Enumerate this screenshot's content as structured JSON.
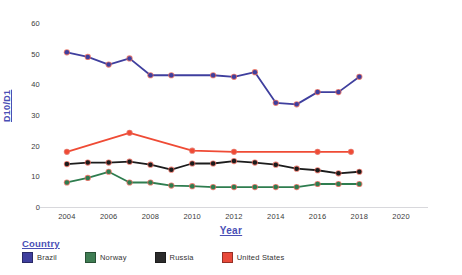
{
  "chart_data": {
    "type": "line",
    "title": "",
    "xlabel": "Year",
    "ylabel": "D10/D1",
    "xlim": [
      2003,
      2021
    ],
    "ylim": [
      0,
      63
    ],
    "xticks": [
      2004,
      2006,
      2008,
      2010,
      2012,
      2014,
      2016,
      2018,
      2020
    ],
    "yticks": [
      0,
      10,
      20,
      30,
      40,
      50,
      60
    ],
    "grid": false,
    "legend_title": "Country",
    "legend_position": "bottom-left",
    "series": [
      {
        "name": "Brazil",
        "color": "#3f3f9e",
        "x": [
          2004,
          2005,
          2006,
          2007,
          2008,
          2009,
          2011,
          2012,
          2013,
          2014,
          2015,
          2016,
          2017,
          2018
        ],
        "values": [
          50.5,
          49.0,
          46.5,
          48.5,
          43.0,
          43.0,
          43.0,
          42.5,
          44.0,
          34.0,
          33.5,
          37.5,
          37.5,
          42.5
        ]
      },
      {
        "name": "Norway",
        "color": "#2e7d4f",
        "x": [
          2004,
          2005,
          2006,
          2007,
          2008,
          2009,
          2010,
          2011,
          2012,
          2013,
          2014,
          2015,
          2016,
          2017,
          2018
        ],
        "values": [
          8.0,
          9.5,
          11.5,
          8.0,
          8.0,
          7.0,
          6.8,
          6.5,
          6.5,
          6.5,
          6.5,
          6.5,
          7.5,
          7.5,
          7.5
        ]
      },
      {
        "name": "Russia",
        "color": "#1c1c1c",
        "x": [
          2004,
          2005,
          2006,
          2007,
          2008,
          2009,
          2010,
          2011,
          2012,
          2013,
          2014,
          2015,
          2016,
          2017,
          2018
        ],
        "values": [
          14.0,
          14.5,
          14.5,
          14.8,
          13.8,
          12.2,
          14.2,
          14.2,
          15.0,
          14.5,
          13.8,
          12.5,
          12.0,
          11.0,
          11.5
        ]
      },
      {
        "name": "United States",
        "color": "#ef4b35",
        "x": [
          2004,
          2007,
          2010,
          2012,
          2016,
          2017.6
        ],
        "values": [
          18.0,
          24.2,
          18.4,
          18.0,
          18.0,
          18.0
        ]
      }
    ]
  },
  "axes": {
    "y_title": "D10/D1",
    "x_title": "Year",
    "y_tick_labels": [
      "0",
      "10",
      "20",
      "30",
      "40",
      "50",
      "60"
    ],
    "x_tick_labels": [
      "2004",
      "2006",
      "2008",
      "2010",
      "2012",
      "2014",
      "2016",
      "2018",
      "2020"
    ]
  },
  "legend": {
    "title": "Country",
    "items": [
      {
        "label": "Brazil",
        "color": "#3f3f9e"
      },
      {
        "label": "Norway",
        "color": "#3f7d53"
      },
      {
        "label": "Russia",
        "color": "#2b2b2b"
      },
      {
        "label": "United States",
        "color": "#e8493a"
      }
    ]
  }
}
